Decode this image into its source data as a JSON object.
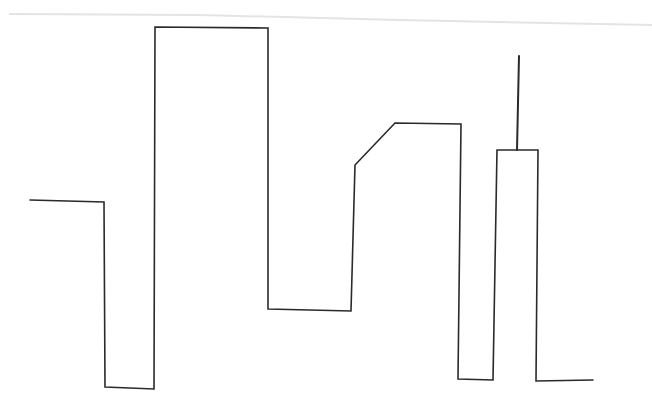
{
  "drawing": {
    "background": "#ffffff",
    "stroke_color": "#2a2a2a",
    "stroke_width": 1.6,
    "smudge_color": "#e4e4e4",
    "main_path": [
      [
        30,
        200
      ],
      [
        104,
        202
      ],
      [
        105,
        387
      ],
      [
        154,
        389
      ],
      [
        155,
        27
      ],
      [
        268,
        28
      ],
      [
        268,
        309
      ],
      [
        351,
        311
      ],
      [
        355,
        165
      ],
      [
        395,
        123
      ],
      [
        461,
        124
      ],
      [
        458,
        379
      ],
      [
        493,
        380
      ],
      [
        497,
        150
      ],
      [
        538,
        150
      ],
      [
        536,
        381
      ],
      [
        593,
        380
      ]
    ],
    "antenna_path": [
      [
        519,
        56
      ],
      [
        517,
        150
      ]
    ],
    "smudge_path": [
      [
        10,
        14
      ],
      [
        200,
        15
      ],
      [
        400,
        20
      ],
      [
        652,
        25
      ]
    ]
  }
}
